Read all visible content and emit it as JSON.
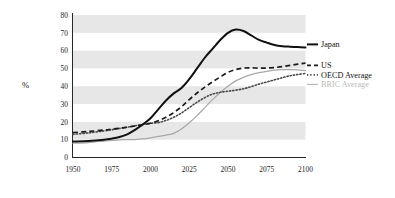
{
  "chart_data": {
    "type": "line",
    "title": "",
    "subtitle": "",
    "xlabel": "",
    "ylabel": "%",
    "xlim": [
      1950,
      2100
    ],
    "ylim": [
      0,
      80
    ],
    "grid": "horizontal-alternating-bands",
    "legend_position": "right",
    "x": [
      1950,
      1960,
      1970,
      1975,
      1980,
      1985,
      1990,
      1995,
      2000,
      2005,
      2010,
      2015,
      2020,
      2025,
      2030,
      2035,
      2040,
      2045,
      2050,
      2055,
      2060,
      2065,
      2070,
      2075,
      2080,
      2085,
      2090,
      2095,
      2100
    ],
    "x_ticks": [
      1950,
      1975,
      2000,
      2025,
      2050,
      2075,
      2100
    ],
    "x_tick_labels": [
      "1950",
      "1975",
      "2000",
      "2025",
      "2050",
      "2075",
      "2100"
    ],
    "y_ticks": [
      0,
      10,
      20,
      30,
      40,
      50,
      60,
      70,
      80
    ],
    "y_tick_labels": [
      "0",
      "10",
      "20",
      "30",
      "40",
      "50",
      "60",
      "70",
      "80"
    ],
    "bands": [
      [
        10,
        20
      ],
      [
        30,
        40
      ],
      [
        50,
        60
      ],
      [
        70,
        80
      ]
    ],
    "series": [
      {
        "name": "Japan",
        "label": "Japan",
        "color": "#111111",
        "style": "solid-thick",
        "values": [
          9,
          9.3,
          10,
          10.6,
          11.5,
          13,
          15.5,
          18.5,
          22,
          27,
          32,
          36,
          39,
          44,
          50,
          56,
          61,
          66,
          70,
          71.8,
          71,
          68.5,
          66,
          64.5,
          63.2,
          62.5,
          62.2,
          62,
          61.8
        ]
      },
      {
        "name": "US",
        "label": "US",
        "color": "#1b1b1b",
        "style": "dashed",
        "values": [
          14,
          14.6,
          15.4,
          15.9,
          16.4,
          17,
          17.7,
          18.4,
          19.2,
          20.6,
          22.6,
          25.2,
          28.5,
          32.5,
          36.2,
          39.5,
          42.5,
          45.2,
          47.8,
          49.4,
          50.2,
          50.3,
          50.2,
          50.2,
          50.5,
          51,
          51.7,
          52.4,
          53
        ]
      },
      {
        "name": "OECD Average",
        "label": "OECD Average",
        "color": "#4a4a4a",
        "style": "dotted",
        "values": [
          13,
          13.8,
          14.9,
          15.6,
          16.3,
          17,
          17.8,
          18.5,
          19.2,
          19.6,
          20.8,
          22.6,
          25,
          28,
          31,
          33.6,
          35.6,
          36.6,
          37.2,
          37.8,
          38.6,
          39.8,
          41.2,
          42.4,
          43.6,
          44.8,
          45.9,
          46.6,
          47.2
        ]
      },
      {
        "name": "BRIC Average",
        "label": "BRIC Average",
        "color": "#a8a8a8",
        "style": "solid-thin",
        "values": [
          8,
          8.4,
          9.2,
          9.6,
          9.9,
          10,
          10.1,
          10.4,
          11,
          11.8,
          12.6,
          13.5,
          16,
          19.5,
          23.5,
          28,
          32.5,
          36.5,
          40,
          43,
          45,
          46.5,
          47.6,
          48.4,
          49,
          49.3,
          49.4,
          49.2,
          48.8
        ]
      }
    ]
  },
  "legend": {
    "items": [
      {
        "label": "Japan"
      },
      {
        "label": "US"
      },
      {
        "label": "OECD Average"
      },
      {
        "label": "BRIC Average"
      }
    ]
  },
  "axis": {
    "y_title": "%"
  }
}
